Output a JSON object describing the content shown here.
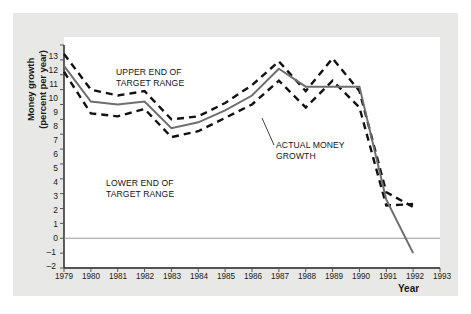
{
  "figure": {
    "background_color": "#e8e8e6",
    "plot_background_color": "#ffffff",
    "axis_label_color": "#1a1a1a"
  },
  "axes": {
    "ylabel_line1": "Money growth",
    "ylabel_line2": "(percent per year)",
    "xlabel": "Year",
    "yticks": [
      "13",
      "12",
      "11",
      "10",
      "9",
      "8",
      "7",
      "6",
      "5",
      "4",
      "3",
      "2",
      "1",
      "0",
      "–1",
      "–2"
    ],
    "xticks": [
      "1979",
      "1980",
      "1981",
      "1982",
      "1983",
      "1984",
      "1985",
      "1986",
      "1987",
      "1988",
      "1989",
      "1990",
      "1991",
      "1992",
      "1993"
    ]
  },
  "annotations": {
    "upper_line1": "UPPER END OF",
    "upper_line2": "TARGET RANGE",
    "lower_line1": "LOWER END OF",
    "lower_line2": "TARGET RANGE",
    "actual_line1": "ACTUAL MONEY",
    "actual_line2": "GROWTH"
  },
  "chart_data": {
    "type": "line",
    "title": "",
    "xlabel": "Year",
    "ylabel": "Money growth (percent per year)",
    "xlim": [
      1979,
      1993
    ],
    "ylim": [
      -2,
      13
    ],
    "grid": false,
    "legend": "annotations-inline",
    "x": [
      1979,
      1980,
      1981,
      1982,
      1983,
      1984,
      1985,
      1986,
      1987,
      1988,
      1989,
      1990,
      1991,
      1992
    ],
    "series": [
      {
        "name": "ACTUAL MONEY GROWTH",
        "style": "solid",
        "color": "#6e6e6e",
        "values": [
          11.6,
          9.2,
          9.0,
          9.2,
          7.4,
          7.8,
          8.6,
          9.6,
          11.4,
          10.2,
          10.2,
          10.2,
          2.6,
          -1.0
        ]
      },
      {
        "name": "UPPER END OF TARGET RANGE",
        "style": "dashed",
        "color": "#111111",
        "values": [
          12.4,
          10.0,
          9.6,
          9.9,
          8.0,
          8.2,
          9.1,
          10.3,
          11.9,
          9.9,
          12.1,
          9.9,
          3.1,
          2.1
        ]
      },
      {
        "name": "LOWER END OF TARGET RANGE",
        "style": "dashed",
        "color": "#111111",
        "values": [
          11.2,
          8.4,
          8.2,
          8.7,
          6.8,
          7.2,
          8.1,
          9.0,
          10.6,
          8.8,
          10.6,
          8.8,
          2.2,
          2.3
        ]
      }
    ]
  }
}
